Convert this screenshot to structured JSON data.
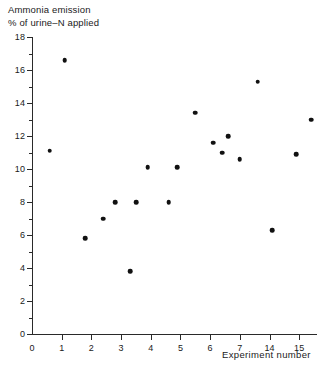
{
  "figure": {
    "title_line1": "Ammonia emission",
    "title_line2": "% of urine–N applied",
    "x_axis_title": "Experiment number"
  },
  "chart_data": {
    "type": "scatter",
    "xlabel": "Experiment number",
    "ylabel": "Ammonia emission % of urine-N applied",
    "xlim": [
      0,
      9.6
    ],
    "ylim": [
      0,
      18
    ],
    "grid": false,
    "legend": null,
    "marker": "filled-circle",
    "marker_color": "#111111",
    "x_tick_labels": [
      "0",
      "1",
      "2",
      "3",
      "4",
      "5",
      "6",
      "7",
      "14",
      "15"
    ],
    "x_tick_values": [
      0,
      1,
      2,
      3,
      4,
      5,
      6,
      7,
      8,
      9
    ],
    "y_tick_labels": [
      "0",
      "2",
      "4",
      "6",
      "8",
      "10",
      "12",
      "14",
      "16",
      "18"
    ],
    "y_tick_values": [
      0,
      2,
      4,
      6,
      8,
      10,
      12,
      14,
      16,
      18
    ],
    "y_minor_ticks": [
      1,
      3,
      5,
      7,
      9,
      11,
      13,
      15,
      17
    ],
    "points": [
      {
        "x": 0.6,
        "y": 11.1
      },
      {
        "x": 1.1,
        "y": 16.6
      },
      {
        "x": 1.8,
        "y": 5.8
      },
      {
        "x": 2.4,
        "y": 7.0
      },
      {
        "x": 2.8,
        "y": 8.0
      },
      {
        "x": 3.3,
        "y": 3.8
      },
      {
        "x": 3.5,
        "y": 8.0
      },
      {
        "x": 3.9,
        "y": 10.1
      },
      {
        "x": 4.6,
        "y": 8.0
      },
      {
        "x": 4.9,
        "y": 10.1
      },
      {
        "x": 5.5,
        "y": 13.4
      },
      {
        "x": 6.1,
        "y": 11.6
      },
      {
        "x": 6.4,
        "y": 11.0
      },
      {
        "x": 6.6,
        "y": 12.0
      },
      {
        "x": 7.0,
        "y": 10.6
      },
      {
        "x": 7.6,
        "y": 15.3
      },
      {
        "x": 8.1,
        "y": 6.3
      },
      {
        "x": 8.9,
        "y": 10.9
      },
      {
        "x": 9.4,
        "y": 13.0
      }
    ]
  }
}
